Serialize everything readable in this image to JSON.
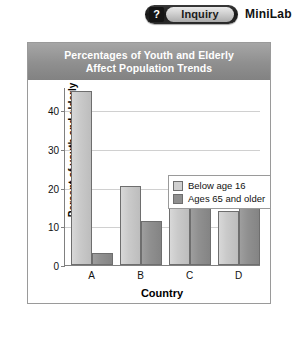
{
  "header": {
    "badge_question_mark": "?",
    "badge_label": "Inquiry",
    "minilab_label": "MiniLab"
  },
  "chart_data": {
    "type": "bar",
    "title_line1": "Percentages of Youth and Elderly",
    "title_line2": "Affect Population Trends",
    "title": "Percentages of Youth and Elderly Affect Population Trends",
    "xlabel": "Country",
    "ylabel": "Percent of youth and elderly\nin the total population",
    "categories": [
      "A",
      "B",
      "C",
      "D"
    ],
    "yticks": [
      0,
      10,
      20,
      30,
      40
    ],
    "ylim": [
      0,
      46
    ],
    "grid": true,
    "legend_position": "inside-top-right",
    "series": [
      {
        "name": "Below age 16",
        "color": "#cacaca",
        "values": [
          45,
          20.5,
          19,
          14
        ]
      },
      {
        "name": "Ages 65 and older",
        "color": "#909090",
        "values": [
          3,
          11.5,
          16,
          20
        ]
      }
    ]
  }
}
